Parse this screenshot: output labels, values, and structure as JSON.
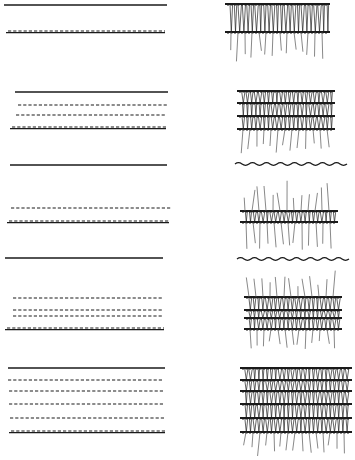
{
  "figure": {
    "colors": {
      "background": "#ffffff",
      "ink": "#1a1a1a",
      "ink_light": "#555555"
    },
    "rows": [
      {
        "id": 1,
        "schematic": [
          {
            "type": "solid",
            "y": 5,
            "x1": 4,
            "x2": 167
          },
          {
            "type": "dashed-solid",
            "y": 32,
            "x1": 6,
            "x2": 165
          }
        ],
        "fabric": {
          "x1": 228,
          "x2": 328,
          "bars": [
            4,
            32
          ],
          "loops_between": true,
          "whiskers_up": 0,
          "whiskers_down": 62,
          "wavy_top": null
        }
      },
      {
        "id": 2,
        "schematic": [
          {
            "type": "solid",
            "y": 92,
            "x1": 15,
            "x2": 168
          },
          {
            "type": "dashed",
            "y": 105,
            "x1": 18,
            "x2": 167
          },
          {
            "type": "dashed",
            "y": 115,
            "x1": 16,
            "x2": 165
          },
          {
            "type": "dashed-solid",
            "y": 128,
            "x1": 10,
            "x2": 166
          }
        ],
        "fabric": {
          "x1": 240,
          "x2": 333,
          "bars": [
            91,
            103,
            116,
            129
          ],
          "loops_between": true,
          "whiskers_up": 0,
          "whiskers_down": 155,
          "wavy_top": null
        }
      },
      {
        "id": 3,
        "schematic": [
          {
            "type": "solid",
            "y": 165,
            "x1": 10,
            "x2": 167
          },
          {
            "type": "dashed",
            "y": 208,
            "x1": 11,
            "x2": 171
          },
          {
            "type": "dashed-solid",
            "y": 222,
            "x1": 7,
            "x2": 169
          }
        ],
        "fabric": {
          "x1": 243,
          "x2": 336,
          "bars": [
            211,
            222
          ],
          "loops_between": true,
          "whiskers_up": 180,
          "whiskers_down": 250,
          "wavy_top": {
            "y": 164,
            "x1": 235,
            "x2": 347
          }
        }
      },
      {
        "id": 4,
        "schematic": [
          {
            "type": "solid",
            "y": 258,
            "x1": 5,
            "x2": 163
          },
          {
            "type": "dashed",
            "y": 298,
            "x1": 13,
            "x2": 163
          },
          {
            "type": "dashed",
            "y": 310,
            "x1": 13,
            "x2": 163
          },
          {
            "type": "dashed",
            "y": 316,
            "x1": 13,
            "x2": 163
          },
          {
            "type": "dashed-solid",
            "y": 329,
            "x1": 5,
            "x2": 164
          }
        ],
        "fabric": {
          "x1": 247,
          "x2": 340,
          "bars": [
            297,
            310,
            318,
            329
          ],
          "loops_between": true,
          "whiskers_up": 270,
          "whiskers_down": 350,
          "wavy_top": {
            "y": 259,
            "x1": 237,
            "x2": 337
          }
        }
      },
      {
        "id": 5,
        "schematic": [
          {
            "type": "solid",
            "y": 368,
            "x1": 8,
            "x2": 165
          },
          {
            "type": "dashed",
            "y": 380,
            "x1": 8,
            "x2": 163
          },
          {
            "type": "dashed",
            "y": 391,
            "x1": 9,
            "x2": 164
          },
          {
            "type": "dashed",
            "y": 404,
            "x1": 9,
            "x2": 164
          },
          {
            "type": "dashed",
            "y": 418,
            "x1": 10,
            "x2": 164
          },
          {
            "type": "dashed-solid",
            "y": 432,
            "x1": 9,
            "x2": 165
          }
        ],
        "fabric": {
          "x1": 243,
          "x2": 350,
          "bars": [
            368,
            380,
            391,
            404,
            418,
            432
          ],
          "loops_between": true,
          "whiskers_up": 0,
          "whiskers_down": 456,
          "wavy_top": null
        }
      }
    ]
  }
}
